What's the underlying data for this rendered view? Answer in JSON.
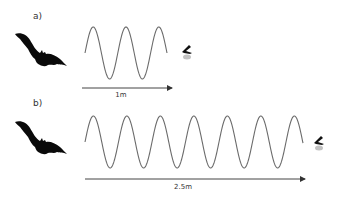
{
  "panels": [
    {
      "label": "a)",
      "label_pos": [
        33,
        19
      ],
      "bat": {
        "x": 15,
        "y": 31,
        "w": 52,
        "h": 36
      },
      "insect": {
        "x": 181,
        "y": 45
      },
      "wave": {
        "x_start": 85,
        "x_end": 167,
        "mid_y": 53,
        "amplitude": 26,
        "period": 32.8,
        "cycles": 2.5,
        "color": "#6b6b6b"
      },
      "arrow": {
        "x1": 82,
        "x2": 172,
        "y": 88
      },
      "distance_label": "1m",
      "distance_label_pos": [
        121,
        97
      ]
    },
    {
      "label": "b)",
      "label_pos": [
        33,
        106
      ],
      "bat": {
        "x": 15,
        "y": 119,
        "w": 52,
        "h": 36
      },
      "insect": {
        "x": 313,
        "y": 136
      },
      "wave": {
        "x_start": 85,
        "x_end": 303,
        "mid_y": 142,
        "amplitude": 26,
        "period": 33.5,
        "cycles": 6.5,
        "color": "#6b6b6b"
      },
      "arrow": {
        "x1": 85,
        "x2": 305,
        "y": 179
      },
      "distance_label": "2.5m",
      "distance_label_pos": [
        183,
        189
      ]
    }
  ],
  "colors": {
    "silhouette": "#0a0a0a",
    "arrow": "#444444",
    "wave": "#6b6b6b",
    "background": "#ffffff"
  }
}
